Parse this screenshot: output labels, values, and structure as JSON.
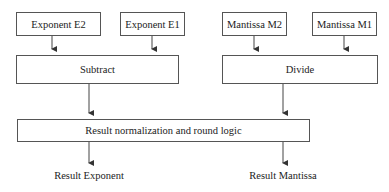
{
  "diagram": {
    "type": "block-diagram",
    "inputs": [
      {
        "id": "e2",
        "label": "Exponent E2"
      },
      {
        "id": "e1",
        "label": "Exponent E1"
      },
      {
        "id": "m2",
        "label": "Mantissa M2"
      },
      {
        "id": "m1",
        "label": "Mantissa M1"
      }
    ],
    "operations": [
      {
        "id": "subtract",
        "label": "Subtract"
      },
      {
        "id": "divide",
        "label": "Divide"
      }
    ],
    "normalization": {
      "label": "Result normalization and round logic"
    },
    "outputs": [
      {
        "id": "result_exponent",
        "label": "Result Exponent"
      },
      {
        "id": "result_mantissa",
        "label": "Result Mantissa"
      }
    ],
    "edges": [
      [
        "Exponent E2",
        "Subtract"
      ],
      [
        "Exponent E1",
        "Subtract"
      ],
      [
        "Mantissa M2",
        "Divide"
      ],
      [
        "Mantissa M1",
        "Divide"
      ],
      [
        "Subtract",
        "Result normalization and round logic"
      ],
      [
        "Divide",
        "Result normalization and round logic"
      ],
      [
        "Result normalization and round logic",
        "Result Exponent"
      ],
      [
        "Result normalization and round logic",
        "Result Mantissa"
      ]
    ],
    "colors": {
      "stroke": "#555555",
      "text": "#222222",
      "background": "#ffffff"
    }
  }
}
